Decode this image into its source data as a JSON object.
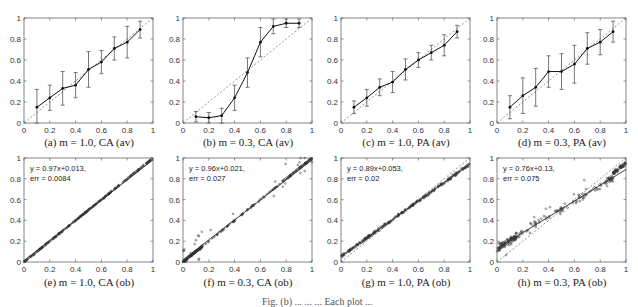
{
  "figure": {
    "bottom_cut_text": "Fig. (b) ... ... ... Each plot ..."
  },
  "chart_data": [
    {
      "id": "a",
      "type": "line",
      "caption": "(a) m = 1.0, CA (av)",
      "x": [
        0.1,
        0.2,
        0.3,
        0.4,
        0.5,
        0.6,
        0.7,
        0.8,
        0.9
      ],
      "y": [
        0.15,
        0.24,
        0.33,
        0.36,
        0.51,
        0.58,
        0.71,
        0.77,
        0.89
      ],
      "err": [
        0.17,
        0.12,
        0.16,
        0.12,
        0.17,
        0.11,
        0.11,
        0.15,
        0.08
      ],
      "reference_line": "y = x (dashed)",
      "xlim": [
        0,
        1
      ],
      "ylim": [
        0,
        1
      ],
      "xticks": [
        "0",
        "0.2",
        "0.4",
        "0.6",
        "0.8",
        "1"
      ],
      "yticks": [
        "0",
        "0.2",
        "0.4",
        "0.6",
        "0.8",
        "1"
      ]
    },
    {
      "id": "b",
      "type": "line",
      "caption": "(b) m = 0.3, CA (av)",
      "x": [
        0.1,
        0.2,
        0.3,
        0.4,
        0.5,
        0.6,
        0.7,
        0.8,
        0.9
      ],
      "y": [
        0.06,
        0.05,
        0.07,
        0.24,
        0.48,
        0.77,
        0.92,
        0.95,
        0.95
      ],
      "err": [
        0.05,
        0.05,
        0.07,
        0.12,
        0.14,
        0.14,
        0.07,
        0.04,
        0.04
      ],
      "reference_line": "y = x (dashed)",
      "xlim": [
        0,
        1
      ],
      "ylim": [
        0,
        1
      ],
      "xticks": [
        "0",
        "0.2",
        "0.4",
        "0.6",
        "0.8",
        "1"
      ],
      "yticks": [
        "0",
        "0.2",
        "0.4",
        "0.6",
        "0.8",
        "1"
      ]
    },
    {
      "id": "c",
      "type": "line",
      "caption": "(c) m = 1.0, PA (av)",
      "x": [
        0.1,
        0.2,
        0.3,
        0.4,
        0.5,
        0.6,
        0.7,
        0.8,
        0.9
      ],
      "y": [
        0.15,
        0.24,
        0.34,
        0.39,
        0.51,
        0.6,
        0.67,
        0.74,
        0.87
      ],
      "err": [
        0.06,
        0.08,
        0.08,
        0.1,
        0.1,
        0.07,
        0.07,
        0.1,
        0.06
      ],
      "reference_line": "y = x (dashed)",
      "xlim": [
        0,
        1
      ],
      "ylim": [
        0,
        1
      ],
      "xticks": [
        "0",
        "0.2",
        "0.4",
        "0.6",
        "0.8",
        "1"
      ],
      "yticks": [
        "0",
        "0.2",
        "0.4",
        "0.6",
        "0.8",
        "1"
      ]
    },
    {
      "id": "d",
      "type": "line",
      "caption": "(d) m = 0.3, PA (av)",
      "x": [
        0.1,
        0.2,
        0.3,
        0.4,
        0.5,
        0.6,
        0.7,
        0.8,
        0.9
      ],
      "y": [
        0.15,
        0.26,
        0.34,
        0.49,
        0.49,
        0.56,
        0.71,
        0.77,
        0.87
      ],
      "err": [
        0.11,
        0.17,
        0.18,
        0.15,
        0.17,
        0.18,
        0.15,
        0.12,
        0.1
      ],
      "reference_line": "y = x (dashed)",
      "xlim": [
        0,
        1
      ],
      "ylim": [
        0,
        1
      ],
      "xticks": [
        "0",
        "0.2",
        "0.4",
        "0.6",
        "0.8",
        "1"
      ],
      "yticks": [
        "0",
        "0.2",
        "0.4",
        "0.6",
        "0.8",
        "1"
      ]
    },
    {
      "id": "e",
      "type": "scatter",
      "caption": "(e) m = 1.0, CA (ob)",
      "fit_label": "y = 0.97x+0.013,",
      "err_label": "err = 0.0084",
      "fit": {
        "slope": 0.97,
        "intercept": 0.013
      },
      "spread": 0.008,
      "outliers": 0.0,
      "reference_line": "y = x (dashed)",
      "xlim": [
        0,
        1
      ],
      "ylim": [
        0,
        1
      ],
      "xticks": [
        "0",
        "0.2",
        "0.4",
        "0.6",
        "0.8",
        "1"
      ],
      "yticks": [
        "0",
        "0.2",
        "0.4",
        "0.6",
        "0.8",
        "1"
      ]
    },
    {
      "id": "f",
      "type": "scatter",
      "caption": "(f) m = 0.3, CA (ob)",
      "fit_label": "y = 0.96x+0.021,",
      "err_label": "err = 0.027",
      "fit": {
        "slope": 0.96,
        "intercept": 0.021
      },
      "spread": 0.01,
      "outliers": 0.12,
      "reference_line": "y = x (dashed)",
      "xlim": [
        0,
        1
      ],
      "ylim": [
        0,
        1
      ],
      "xticks": [
        "0",
        "0.2",
        "0.4",
        "0.6",
        "0.8",
        "1"
      ],
      "yticks": [
        "0",
        "0.2",
        "0.4",
        "0.6",
        "0.8",
        "1"
      ]
    },
    {
      "id": "g",
      "type": "scatter",
      "caption": "(g) m = 1.0, PA (ob)",
      "fit_label": "y = 0.89x+0.053,",
      "err_label": "err = 0.02",
      "fit": {
        "slope": 0.89,
        "intercept": 0.053
      },
      "spread": 0.02,
      "outliers": 0.0,
      "reference_line": "y = x (dashed)",
      "xlim": [
        0,
        1
      ],
      "ylim": [
        0,
        1
      ],
      "xticks": [
        "0",
        "0.2",
        "0.4",
        "0.6",
        "0.8",
        "1"
      ],
      "yticks": [
        "0",
        "0.2",
        "0.4",
        "0.6",
        "0.8",
        "1"
      ]
    },
    {
      "id": "h",
      "type": "scatter",
      "caption": "(h) m = 0.3, PA (ob)",
      "fit_label": "y = 0.76x+0.13,",
      "err_label": "err = 0.075",
      "fit": {
        "slope": 0.76,
        "intercept": 0.13
      },
      "spread": 0.06,
      "outliers": 0.1,
      "reference_line": "y = x (dashed)",
      "xlim": [
        0,
        1
      ],
      "ylim": [
        0,
        1
      ],
      "xticks": [
        "0",
        "0.2",
        "0.4",
        "0.6",
        "0.8",
        "1"
      ],
      "yticks": [
        "0",
        "0.2",
        "0.4",
        "0.6",
        "0.8",
        "1"
      ]
    }
  ]
}
